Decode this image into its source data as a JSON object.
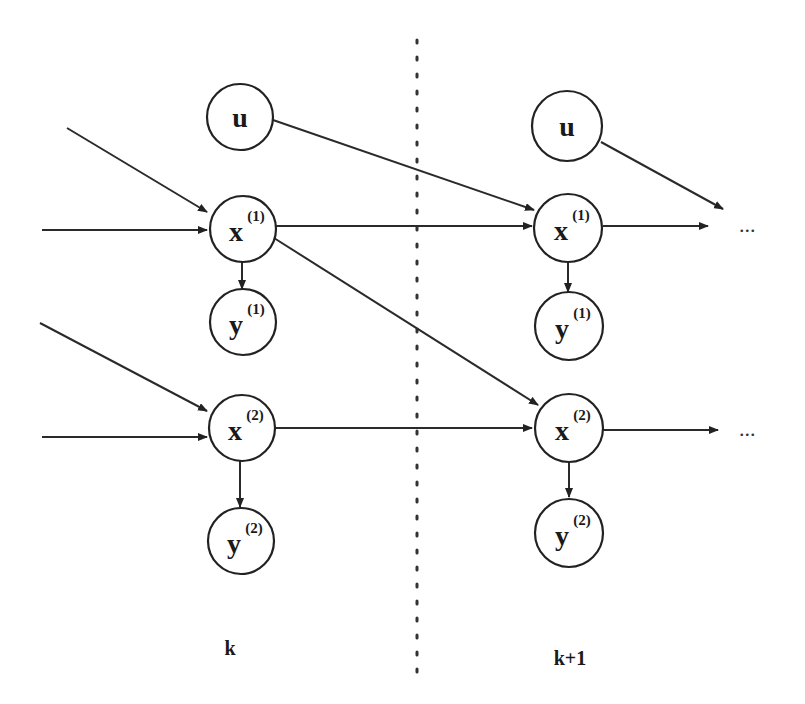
{
  "diagram": {
    "type": "dynamic-bayesian-network",
    "divider": "dotted-vertical",
    "time_labels": {
      "left": "k",
      "right": "k+1"
    },
    "continuation": "...",
    "slices": [
      {
        "label": "k",
        "nodes": [
          {
            "id": "u_k",
            "base": "u",
            "sup": ""
          },
          {
            "id": "x1_k",
            "base": "x",
            "sup": "(1)"
          },
          {
            "id": "y1_k",
            "base": "y",
            "sup": "(1)"
          },
          {
            "id": "x2_k",
            "base": "x",
            "sup": "(2)"
          },
          {
            "id": "y2_k",
            "base": "y",
            "sup": "(2)"
          }
        ]
      },
      {
        "label": "k+1",
        "nodes": [
          {
            "id": "u_k1",
            "base": "u",
            "sup": ""
          },
          {
            "id": "x1_k1",
            "base": "x",
            "sup": "(1)"
          },
          {
            "id": "y1_k1",
            "base": "y",
            "sup": "(1)"
          },
          {
            "id": "x2_k1",
            "base": "x",
            "sup": "(2)"
          },
          {
            "id": "y2_k1",
            "base": "y",
            "sup": "(2)"
          }
        ]
      }
    ],
    "edges": [
      [
        "u_k",
        "x1_k1"
      ],
      [
        "x1_k",
        "x1_k1"
      ],
      [
        "x1_k",
        "x2_k1"
      ],
      [
        "x2_k",
        "x2_k1"
      ],
      [
        "x1_k",
        "y1_k"
      ],
      [
        "x2_k",
        "y2_k"
      ],
      [
        "x1_k1",
        "y1_k1"
      ],
      [
        "x2_k1",
        "y2_k1"
      ],
      [
        "u_k1",
        "next"
      ],
      [
        "x1_k1",
        "next"
      ],
      [
        "x2_k1",
        "next"
      ]
    ]
  }
}
